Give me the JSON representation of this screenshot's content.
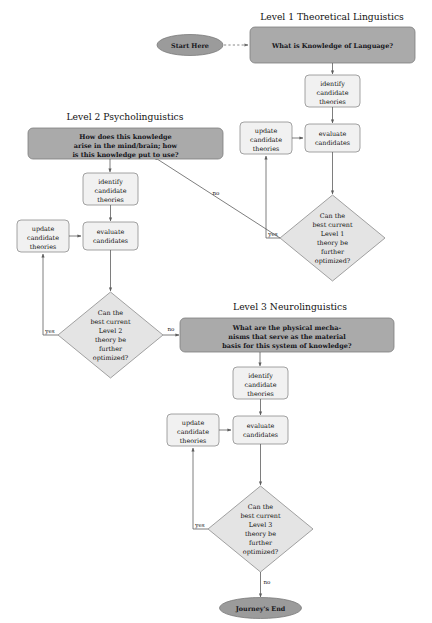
{
  "diagram": {
    "colors": {
      "header_fill": "#aaaaaa",
      "process_fill": "#f1f1f1",
      "decision_fill": "#e4e4e4",
      "terminal_fill": "#9b9b9b",
      "stroke": "#5d5d5d",
      "background": "#ffffff"
    },
    "terminals": {
      "start": "Start Here",
      "end": "Journey's End"
    },
    "sections": [
      {
        "id": "level1",
        "title": "Level 1 Theoretical Linguistics",
        "question_lines": [
          "What is Knowledge of Language?"
        ],
        "identify": [
          "identify",
          "candidate",
          "theories"
        ],
        "evaluate": [
          "evaluate",
          "candidates"
        ],
        "update": [
          "update",
          "candidate",
          "theories"
        ],
        "decision_lines": [
          "Can the",
          "best current",
          "Level 1",
          "theory be",
          "further",
          "optimized?"
        ],
        "yes_label": "yes",
        "no_label": "no"
      },
      {
        "id": "level2",
        "title": "Level 2 Psycholinguistics",
        "question_lines": [
          "How does this knowledge",
          "arise in the mind/brain; how",
          "is this knowledge put to use?"
        ],
        "identify": [
          "identify",
          "candidate",
          "theories"
        ],
        "evaluate": [
          "evaluate",
          "candidates"
        ],
        "update": [
          "update",
          "candidate",
          "theories"
        ],
        "decision_lines": [
          "Can the",
          "best current",
          "Level 2",
          "theory be",
          "further",
          "optimized?"
        ],
        "yes_label": "yes",
        "no_label": "no"
      },
      {
        "id": "level3",
        "title": "Level 3 Neurolinguistics",
        "question_lines": [
          "What are the physical mecha-",
          "nisms that serve as the material",
          "basis for this system of knowledge?"
        ],
        "identify": [
          "identify",
          "candidate",
          "theories"
        ],
        "evaluate": [
          "evaluate",
          "candidates"
        ],
        "update": [
          "update",
          "candidate",
          "theories"
        ],
        "decision_lines": [
          "Can the",
          "best current",
          "Level 3",
          "theory be",
          "further",
          "optimized?"
        ],
        "yes_label": "yes",
        "no_label": "no"
      }
    ]
  }
}
